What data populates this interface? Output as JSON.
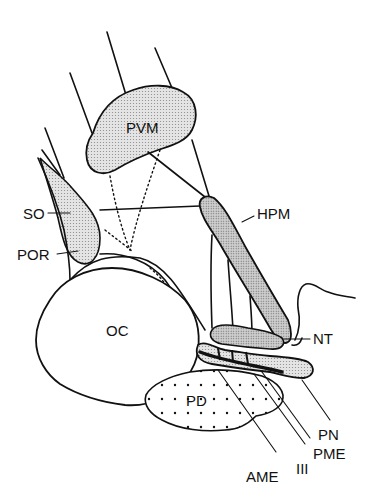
{
  "diagram": {
    "labels": {
      "pvm": "PVM",
      "so": "SO",
      "hpm": "HPM",
      "por": "POR",
      "oc": "OC",
      "nt": "NT",
      "pd": "PD",
      "pn": "PN",
      "pme": "PME",
      "iii": "III",
      "ame": "AME"
    },
    "colors": {
      "line": "#111111",
      "stipple_fill": "#d9d9d9",
      "hpm_fill": "#c8c8c8",
      "background": "#ffffff"
    }
  }
}
